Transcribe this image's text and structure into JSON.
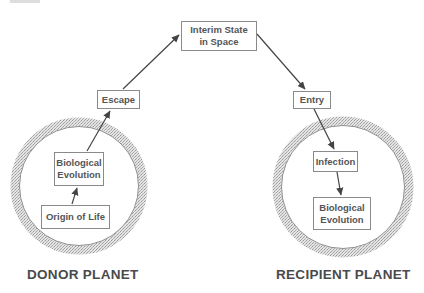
{
  "figure": {
    "tag_partial": "",
    "nodes": {
      "interim": "Interim State\nin Space",
      "escape": "Escape",
      "entry": "Entry",
      "donor_bio_evolution": "Biological\nEvolution",
      "origin_of_life": "Origin of Life",
      "infection": "Infection",
      "recipient_bio_evolution": "Biological\nEvolution"
    },
    "planets": {
      "donor_label": "DONOR PLANET",
      "recipient_label": "RECIPIENT PLANET"
    },
    "colors": {
      "ring": "#c8c8c8",
      "ring_edge": "#8f8f8f",
      "box_border": "#8a8a8a",
      "text": "#555555",
      "arrow": "#444444"
    }
  }
}
